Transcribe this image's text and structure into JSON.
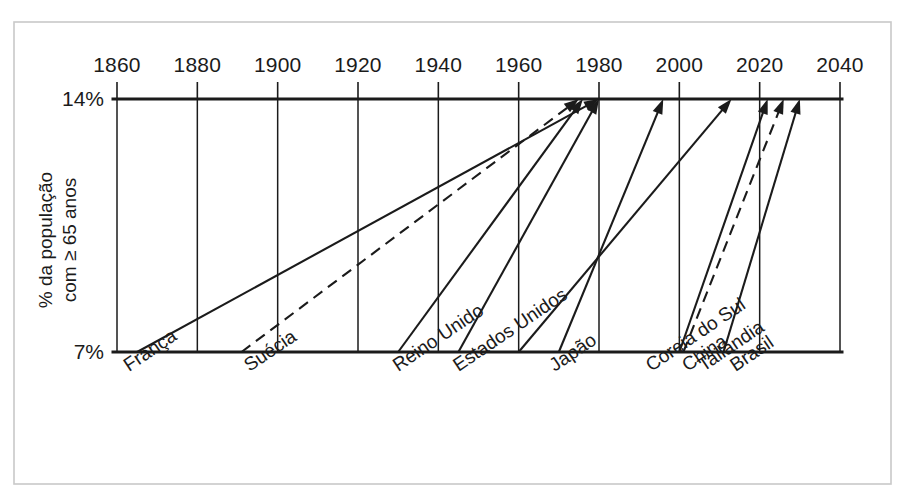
{
  "chart_data": {
    "type": "line",
    "title": "",
    "subtitle": "",
    "xlabel": "",
    "ylabel": "% da população com ≥ 65 anos",
    "ylabel_line1": "% da população",
    "ylabel_line2": "com ≥ 65 anos",
    "xlim": [
      1855,
      2045
    ],
    "ylim": [
      7,
      14
    ],
    "x_ticks": [
      1860,
      1880,
      1900,
      1920,
      1940,
      1960,
      1980,
      2000,
      2020,
      2040
    ],
    "x_tick_labels": [
      "1860",
      "1880",
      "1900",
      "1920",
      "1940",
      "1960",
      "1980",
      "2000",
      "2020",
      "2040"
    ],
    "y_ticks": [
      7,
      14
    ],
    "y_tick_labels": [
      "7%",
      "14%"
    ],
    "grid": "vertical",
    "legend": "none",
    "annotation": "Cada seta vai de 7% até 14% da população com 65 anos ou mais",
    "series": [
      {
        "name": "França",
        "label": "França",
        "style": "solid",
        "start_year": 1865,
        "end_year": 1980,
        "start_value": 7,
        "end_value": 14,
        "duration_years": 115
      },
      {
        "name": "Suécia",
        "label": "Suécia",
        "style": "dashed",
        "start_year": 1891,
        "end_year": 1975,
        "start_value": 7,
        "end_value": 14,
        "duration_years": 84
      },
      {
        "name": "Reino Unido",
        "label": "Reino Unido",
        "style": "solid",
        "start_year": 1930,
        "end_year": 1976,
        "start_value": 7,
        "end_value": 14,
        "duration_years": 46
      },
      {
        "name": "Estados Unidos",
        "label": "Estados Unidos",
        "style": "solid",
        "start_year": 1945,
        "end_year": 1980,
        "start_value": 7,
        "end_value": 14,
        "duration_years": 35
      },
      {
        "name": "Japão",
        "label": "Japão",
        "style": "solid",
        "start_year": 1970,
        "end_year": 1996,
        "start_value": 7,
        "end_value": 14,
        "duration_years": 26
      },
      {
        "name": "Coreia do Sul",
        "label": "Coreia do Sul",
        "style": "solid",
        "start_year": 1960,
        "end_year": 2013,
        "start_value": 7,
        "end_value": 14,
        "duration_years": 53
      },
      {
        "name": "China",
        "label": "China",
        "style": "solid",
        "start_year": 2000,
        "end_year": 2022,
        "start_value": 7,
        "end_value": 14,
        "duration_years": 22
      },
      {
        "name": "Tailândia",
        "label": "Tailândia",
        "style": "dashed",
        "start_year": 2001,
        "end_year": 2026,
        "start_value": 7,
        "end_value": 14,
        "duration_years": 25
      },
      {
        "name": "Brasil",
        "label": "Brasil",
        "style": "solid",
        "start_year": 2011,
        "end_year": 2030,
        "start_value": 7,
        "end_value": 14,
        "duration_years": 19
      }
    ],
    "country_label_anchors": [
      {
        "name": "França",
        "year": 1863
      },
      {
        "name": "Suécia",
        "year": 1893
      },
      {
        "name": "Reino Unido",
        "year": 1930
      },
      {
        "name": "Estados Unidos",
        "year": 1945
      },
      {
        "name": "Japão",
        "year": 1969
      },
      {
        "name": "Coreia do Sul",
        "year": 1993
      },
      {
        "name": "China",
        "year": 2002
      },
      {
        "name": "Tailândia",
        "year": 2006
      },
      {
        "name": "Brasil",
        "year": 2014
      }
    ]
  },
  "colors": {
    "ink": "#1b1b1b",
    "frame": "#c9c9c9",
    "background": "#ffffff"
  }
}
